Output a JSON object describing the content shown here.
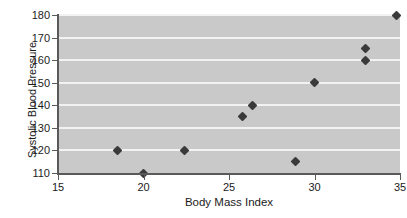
{
  "chart_data": {
    "type": "scatter",
    "title": "",
    "xlabel": "Body Mass Index",
    "ylabel": "Systolic Blood Pressure",
    "xlim": [
      15,
      35
    ],
    "ylim": [
      110,
      180
    ],
    "xticks": [
      15,
      20,
      25,
      30,
      35
    ],
    "yticks": [
      110,
      120,
      130,
      140,
      150,
      160,
      170,
      180
    ],
    "grid": "horizontal",
    "legend": "none",
    "marker": "diamond",
    "marker_color": "#3a3a3a",
    "plot_background": "#c9c9c9",
    "gridline_color": "#f2f2f2",
    "axis_color": "#5a5a5a",
    "points": [
      {
        "x": 18.5,
        "y": 120
      },
      {
        "x": 20.0,
        "y": 110
      },
      {
        "x": 22.4,
        "y": 120
      },
      {
        "x": 25.8,
        "y": 135
      },
      {
        "x": 26.4,
        "y": 140
      },
      {
        "x": 28.9,
        "y": 115
      },
      {
        "x": 30.0,
        "y": 150
      },
      {
        "x": 33.0,
        "y": 165
      },
      {
        "x": 33.0,
        "y": 160
      },
      {
        "x": 34.8,
        "y": 180
      }
    ]
  }
}
